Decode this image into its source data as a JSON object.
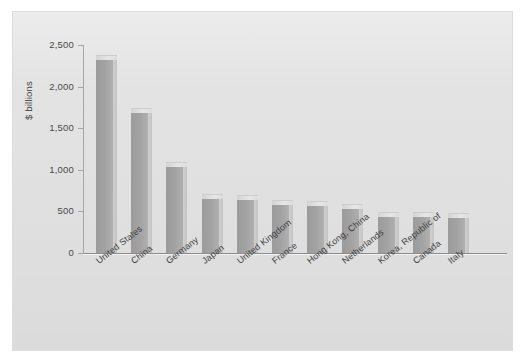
{
  "chart_data": {
    "type": "bar",
    "title": "",
    "subtitle": "",
    "xlabel": "",
    "ylabel": "$ billions",
    "ylim": [
      0,
      2500
    ],
    "ytick_labels": [
      "0",
      "500",
      "1,000",
      "1,500",
      "2,000",
      "2,500"
    ],
    "ytick_values": [
      0,
      500,
      1000,
      1500,
      2000,
      2500
    ],
    "grid": false,
    "legend": false,
    "legend_position": "none",
    "bar_style": "3d-extruded",
    "categories": [
      "United States",
      "China",
      "Germany",
      "Japan",
      "United Kingdom",
      "France",
      "Hong Kong, China",
      "Netherlands",
      "Korea, Republic of",
      "Canada",
      "Italy"
    ],
    "values": [
      2330,
      1690,
      1040,
      665,
      650,
      590,
      580,
      545,
      450,
      450,
      430
    ]
  },
  "colors": {
    "figure_background": "#ffffff",
    "panel_background": "#e2e2e2",
    "bar_fill": "#a3a3a3",
    "bar_top": "#dedede",
    "bar_side": "#c8c8c8",
    "axis_line": "#8d8d8d",
    "tick_label": "#4a4a4a",
    "axis_title": "#3f3f3f"
  }
}
